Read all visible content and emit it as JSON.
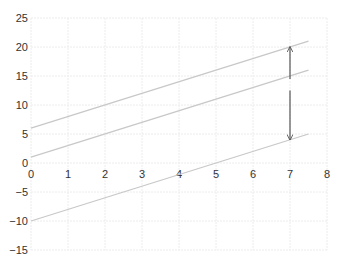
{
  "chart_data": {
    "type": "line",
    "title": "",
    "xlabel": "",
    "ylabel": "",
    "xlim": [
      0,
      8
    ],
    "ylim": [
      -15,
      25
    ],
    "grid": true,
    "x_ticks": [
      0,
      1,
      2,
      3,
      4,
      5,
      6,
      7,
      8
    ],
    "y_ticks": [
      -15,
      -10,
      -5,
      0,
      5,
      10,
      15,
      20,
      25
    ],
    "x_tick_labels": [
      "0",
      "1",
      "2",
      "3",
      "4",
      "5",
      "6",
      "7",
      "8"
    ],
    "y_tick_labels": [
      "−15",
      "−10",
      "−5",
      "0",
      "5",
      "10",
      "15",
      "20",
      "25"
    ],
    "series": [
      {
        "name": "upper line",
        "x": [
          0,
          7.5
        ],
        "y": [
          6,
          21
        ],
        "color": "#c8c8c8"
      },
      {
        "name": "middle line",
        "x": [
          0,
          7.5
        ],
        "y": [
          1,
          16
        ],
        "color": "#c8c8c8"
      },
      {
        "name": "lower line",
        "x": [
          0,
          7.5
        ],
        "y": [
          -10,
          5
        ],
        "color": "#c8c8c8"
      }
    ],
    "annotations": [
      {
        "type": "double-arrow",
        "x": 7,
        "y_from": 14.5,
        "y_to": 20,
        "color": "#555555"
      },
      {
        "type": "double-arrow",
        "x": 7,
        "y_from": 12.5,
        "y_to": 4,
        "color": "#555555"
      }
    ],
    "legend": null
  }
}
